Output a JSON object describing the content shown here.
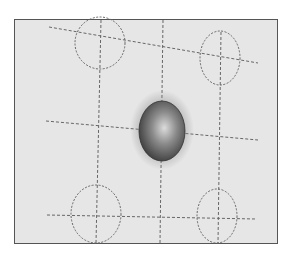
{
  "image": {
    "description": "Photograph of a gray sheet with a dashed grid of lines and five target ellipses; a dark shaded elliptical spot sits at the center intersection",
    "colors": {
      "background": "#ffffff",
      "sheet": "#e6e6e6",
      "border": "#555555",
      "lines": "#666666",
      "spot_dark": "#3c3c3c",
      "spot_highlight": "#d8d8d8"
    },
    "ellipses": [
      {
        "name": "top-left",
        "cx": 100,
        "cy": 43,
        "rx": 25,
        "ry": 26
      },
      {
        "name": "top-right",
        "cx": 220,
        "cy": 58,
        "rx": 20,
        "ry": 27
      },
      {
        "name": "bottom-left",
        "cx": 96,
        "cy": 214,
        "rx": 25,
        "ry": 29
      },
      {
        "name": "bottom-right",
        "cx": 217,
        "cy": 216,
        "rx": 20,
        "ry": 27
      }
    ],
    "center_spot": {
      "cx": 162,
      "cy": 131,
      "rx": 23,
      "ry": 30
    }
  }
}
